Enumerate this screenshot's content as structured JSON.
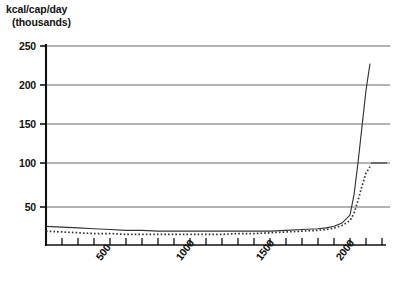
{
  "chart_data": {
    "type": "line",
    "title": "",
    "subtitle": "",
    "ylabel_line1": "kcal/cap/day",
    "ylabel_line2": "(thousands)",
    "xlabel": "",
    "ylim": [
      0,
      250
    ],
    "xlim": [
      0,
      2100
    ],
    "yticks": [
      50,
      100,
      150,
      200,
      250
    ],
    "ytick_labels": [
      "50",
      "100",
      "150",
      "200",
      "250"
    ],
    "xticks": [
      0,
      100,
      200,
      300,
      400,
      500,
      600,
      700,
      800,
      900,
      1000,
      1100,
      1200,
      1300,
      1400,
      1500,
      1600,
      1700,
      1800,
      1900,
      2000,
      2100
    ],
    "xtick_labels_shown": [
      "500",
      "1000",
      "1500",
      "2000"
    ],
    "xtick_labels_shown_at": [
      500,
      1000,
      1500,
      2000
    ],
    "grid": "horizontal",
    "legend": "none",
    "series": [
      {
        "name": "solid-series",
        "style": "solid",
        "color": "#333333",
        "x": [
          0,
          100,
          200,
          300,
          400,
          500,
          600,
          700,
          800,
          900,
          1000,
          1100,
          1200,
          1300,
          1400,
          1500,
          1600,
          1700,
          1750,
          1800,
          1850,
          1900,
          1925,
          1950,
          1975,
          2000,
          2025
        ],
        "y": [
          26,
          25,
          24,
          23,
          22,
          21,
          21,
          20,
          20,
          20,
          20,
          20,
          20,
          20,
          20,
          21,
          22,
          23,
          24,
          26,
          30,
          40,
          65,
          105,
          150,
          195,
          228
        ]
      },
      {
        "name": "dotted-series",
        "style": "dotted",
        "color": "#333333",
        "x": [
          0,
          100,
          200,
          300,
          400,
          500,
          600,
          700,
          800,
          900,
          1000,
          1100,
          1200,
          1300,
          1400,
          1500,
          1600,
          1700,
          1750,
          1800,
          1850,
          1900,
          1925,
          1950,
          1975,
          2000,
          2025
        ],
        "y": [
          20,
          19,
          18,
          17,
          17,
          16,
          16,
          16,
          16,
          16,
          16,
          16,
          17,
          17,
          18,
          19,
          20,
          21,
          22,
          24,
          27,
          33,
          42,
          58,
          76,
          92,
          100
        ]
      }
    ]
  }
}
